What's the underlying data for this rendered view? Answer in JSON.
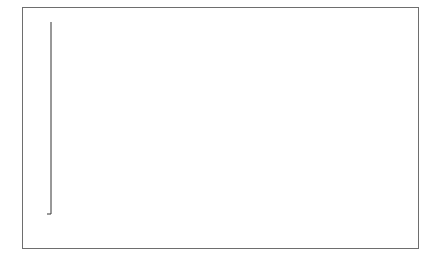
{
  "chart_data": {
    "type": "bar",
    "title": "",
    "xlabel": "",
    "ylabel": "DALYs (in Millions)",
    "ylim": [
      0,
      200
    ],
    "yticks": [
      0,
      20,
      40,
      60,
      80,
      100,
      120,
      140,
      160,
      180,
      200
    ],
    "grid": false,
    "legend": null,
    "categories": [
      "Cancer",
      "Heart disease",
      "Stroke",
      "Low back pain",
      "COPDᵃ",
      "Depression"
    ],
    "category_lines": [
      [
        "Cancer"
      ],
      [
        "Heart",
        "disease"
      ],
      [
        "Stroke"
      ],
      [
        "Low back",
        "pain"
      ],
      [
        "COPD",
        "a"
      ],
      [
        "Depression"
      ]
    ],
    "values": [
      188.4,
      129.8,
      102.2,
      83.1,
      76.7,
      74.3
    ],
    "value_labels": [
      "188.4",
      "129.8",
      "102.2",
      "83.1",
      "76.7",
      "74.3"
    ],
    "bar_color": "#6b6b6b"
  }
}
